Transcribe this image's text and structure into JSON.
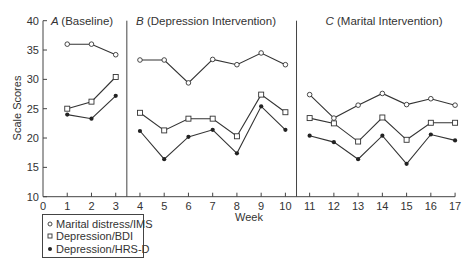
{
  "chart_data": {
    "type": "line",
    "title": "",
    "xlabel": "Week",
    "ylabel": "Scale Scores",
    "xlim": [
      0,
      17
    ],
    "ylim": [
      10,
      40
    ],
    "xticks": [
      0,
      1,
      2,
      3,
      4,
      5,
      6,
      7,
      8,
      9,
      10,
      11,
      12,
      13,
      14,
      15,
      16,
      17
    ],
    "yticks": [
      10,
      15,
      20,
      25,
      30,
      35,
      40
    ],
    "grid": false,
    "legend_position": "bottom-left",
    "phases": [
      {
        "letter": "A",
        "label": "(Baseline)",
        "weeks": [
          1,
          3
        ]
      },
      {
        "letter": "B",
        "label": "(Depression Intervention)",
        "weeks": [
          4,
          10
        ]
      },
      {
        "letter": "C",
        "label": "(Marital Intervention)",
        "weeks": [
          11,
          17
        ]
      }
    ],
    "phase_dividers": [
      3.5,
      10.5
    ],
    "series": [
      {
        "name": "Marital distress/IMS",
        "marker": "open-circle",
        "x": [
          1,
          2,
          3,
          4,
          5,
          6,
          7,
          8,
          9,
          10,
          11,
          12,
          13,
          14,
          15,
          16,
          17
        ],
        "values": [
          36,
          36,
          34.2,
          33.3,
          33.3,
          29.4,
          33.4,
          32.5,
          34.5,
          32.5,
          27.4,
          23.4,
          25.6,
          27.6,
          25.7,
          26.7,
          25.6
        ]
      },
      {
        "name": "Depression/BDI",
        "marker": "open-square",
        "x": [
          1,
          2,
          3,
          4,
          5,
          6,
          7,
          8,
          9,
          10,
          11,
          12,
          13,
          14,
          15,
          16,
          17
        ],
        "values": [
          25,
          26.2,
          30.4,
          24.3,
          21.3,
          23.3,
          23.3,
          20.3,
          27.4,
          24.4,
          23.4,
          22.5,
          19.4,
          23.5,
          19.7,
          22.6,
          22.6
        ]
      },
      {
        "name": "Depression/HRS-D",
        "marker": "filled-circle",
        "x": [
          1,
          2,
          3,
          4,
          5,
          6,
          7,
          8,
          9,
          10,
          11,
          12,
          13,
          14,
          15,
          16,
          17
        ],
        "values": [
          24,
          23.3,
          27.2,
          21.2,
          16.4,
          20.2,
          21.4,
          17.4,
          25.4,
          21.4,
          20.4,
          19.3,
          16.4,
          20.4,
          15.6,
          20.6,
          19.6
        ]
      }
    ]
  },
  "legend": {
    "items": [
      {
        "label": "Marital distress/IMS",
        "symbol": "○"
      },
      {
        "label": "Depression/BDI",
        "symbol": "□"
      },
      {
        "label": "Depression/HRS-D",
        "symbol": "●"
      }
    ]
  },
  "colors": {
    "line": "#333333",
    "marker_fill_open": "#ffffff",
    "marker_fill_solid": "#222222",
    "background": "#ffffff"
  }
}
